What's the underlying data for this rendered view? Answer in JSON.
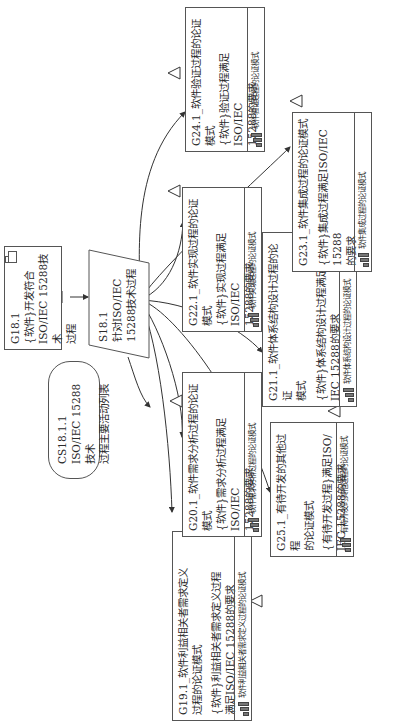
{
  "diagram": {
    "type": "GSN argument structure",
    "orientation": "rotated 90deg counter-clockwise",
    "top_goal": {
      "id": "G18.1",
      "text": "{软件}开发符合ISO/IEC 15288技术过程",
      "lines": [
        "G18.1",
        "{软件}开发符合",
        "ISO/IEC 15288技术",
        "过程"
      ]
    },
    "strategy": {
      "id": "S18.1",
      "lines": [
        "S18.1",
        "针对ISO/IEC",
        "15288技术过程",
        "展开论证"
      ]
    },
    "context": {
      "id": "CS18.1.1",
      "lines": [
        "CS18.1.1",
        "ISO/IEC 15288技术",
        "过程主要活动列表"
      ]
    },
    "sub_goals": [
      {
        "id": "G19.1",
        "title_lines": [
          "G19.1_软件利益相关者需求定义",
          "过程的论证模式"
        ],
        "body_lines": [
          "{软件}利益相关者需求定义过程",
          "满足ISO/IEC 15288的要求"
        ],
        "footer": "软件利益相关者需求定义过程的论证模式"
      },
      {
        "id": "G20.1",
        "title_lines": [
          "G20.1_软件需求分析过程的论证",
          "模式"
        ],
        "body_lines": [
          "{软件}需求分析过程满足ISO/IEC",
          "15288的要求"
        ],
        "footer": "软件需求分析过程的论证模式"
      },
      {
        "id": "G25.1",
        "title_lines": [
          "G25.1_有待开发的其他过程",
          "的论证模式"
        ],
        "body_lines": [
          "{有待开发过程}满足ISO/",
          "IEC 15288的要求"
        ],
        "footer": "有待开发的其他过程的论证模式"
      },
      {
        "id": "G21.1",
        "title_lines": [
          "G21.1_软件体系结构设计过程的论证",
          "模式"
        ],
        "body_lines": [
          "{软件}体系结构设计过程满足ISO/",
          "IEC 15288的要求"
        ],
        "footer": "软件体系结构设计过程的论证模式"
      },
      {
        "id": "G22.1",
        "title_lines": [
          "G22.1_软件实现过程的论证",
          "模式"
        ],
        "body_lines": [
          "{软件}实现过程满足ISO/IEC",
          "15288的要求"
        ],
        "footer": "软件实现过程的论证模式"
      },
      {
        "id": "G23.1",
        "title_lines": [
          "G23.1_软件集成过程的论证模式"
        ],
        "body_lines": [
          "{软件}集成过程满足ISO/IEC 15288",
          "的要求"
        ],
        "footer": "软件集成过程的论证模式"
      },
      {
        "id": "G24.1",
        "title_lines": [
          "G24.1_软件验证过程的论证",
          "模式"
        ],
        "body_lines": [
          "{软件}验证过程满足ISO/IEC",
          "15288的要求"
        ],
        "footer": "软件验证过程的论证模式"
      }
    ]
  }
}
